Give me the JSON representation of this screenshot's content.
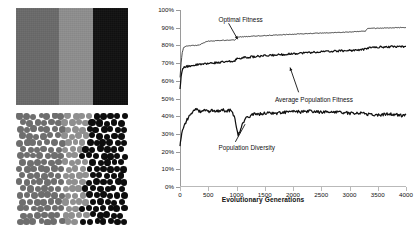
{
  "figure": {
    "bands_panel": {
      "name": "grayscale-bands-image",
      "bands": [
        {
          "label": "dark-gray-band",
          "color": "#6a6a6a",
          "width_pct": 38
        },
        {
          "label": "light-gray-band",
          "color": "#8e8e8e",
          "width_pct": 31
        },
        {
          "label": "black-band",
          "color": "#111111",
          "width_pct": 31
        }
      ]
    },
    "circles_panel": {
      "name": "circle-packing-image",
      "colors": {
        "left": "#6e6e6e",
        "middle": "#8f8f8f",
        "right": "#0d0d0d"
      },
      "dot_radius": 3.2,
      "columns": 16,
      "rows": 17
    }
  },
  "chart_data": {
    "type": "line",
    "title": "",
    "xlabel": "Evolutionary Generations",
    "ylabel": "",
    "xlim": [
      0,
      4000
    ],
    "ylim": [
      0,
      100
    ],
    "grid": false,
    "legend_position": "inline-annotations",
    "xticks": [
      0,
      500,
      1000,
      1500,
      2000,
      2500,
      3000,
      3500,
      4000
    ],
    "xtick_labels": [
      "0",
      "500",
      "1000",
      "1500",
      "2000",
      "2500",
      "3000",
      "3500",
      "4000"
    ],
    "yticks": [
      0,
      10,
      20,
      30,
      40,
      50,
      60,
      70,
      80,
      90,
      100
    ],
    "ytick_labels": [
      "0%",
      "10%",
      "20%",
      "30%",
      "40%",
      "50%",
      "60%",
      "70%",
      "80%",
      "90%",
      "100%"
    ],
    "series": [
      {
        "name": "Optimal Fitness",
        "color": "#1a1a1a",
        "x": [
          0,
          20,
          40,
          60,
          80,
          120,
          180,
          260,
          340,
          420,
          500,
          600,
          700,
          800,
          900,
          980,
          1020,
          1100,
          1250,
          1400,
          1600,
          1800,
          2000,
          2200,
          2400,
          2600,
          2800,
          3000,
          3150,
          3280,
          3320,
          3400,
          3600,
          3800,
          3950,
          4000
        ],
        "values": [
          62,
          70,
          76,
          78.5,
          79.2,
          79.6,
          79.8,
          80.0,
          80.2,
          81.5,
          82.4,
          82.6,
          82.8,
          82.9,
          83.0,
          83.1,
          84.6,
          84.9,
          85.1,
          85.4,
          85.7,
          86.0,
          86.3,
          86.6,
          86.9,
          87.1,
          87.3,
          87.6,
          87.8,
          88.0,
          89.4,
          89.6,
          89.8,
          90.0,
          90.1,
          90.1
        ]
      },
      {
        "name": "Average Population Fitness",
        "color": "#111111",
        "x": [
          0,
          20,
          40,
          60,
          90,
          140,
          200,
          300,
          400,
          500,
          620,
          740,
          860,
          960,
          1010,
          1080,
          1200,
          1350,
          1500,
          1700,
          1900,
          2100,
          2300,
          2500,
          2700,
          2900,
          3100,
          3250,
          3320,
          3450,
          3600,
          3750,
          3900,
          4000
        ],
        "values": [
          55,
          62,
          66,
          67.2,
          67.8,
          68.2,
          68.6,
          69.0,
          69.4,
          69.8,
          70.2,
          70.5,
          70.8,
          71.0,
          72.6,
          72.9,
          73.3,
          73.7,
          74.1,
          74.6,
          75.1,
          75.6,
          76.0,
          76.4,
          76.7,
          77.0,
          77.3,
          77.6,
          78.6,
          78.9,
          79.1,
          79.3,
          79.4,
          79.4
        ]
      },
      {
        "name": "Population Diversity",
        "color": "#111111",
        "x": [
          0,
          15,
          30,
          60,
          100,
          150,
          200,
          250,
          300,
          350,
          420,
          500,
          580,
          660,
          740,
          820,
          900,
          960,
          1000,
          1030,
          1060,
          1100,
          1160,
          1250,
          1350,
          1450,
          1550,
          1700,
          1850,
          2000,
          2150,
          2300,
          2450,
          2600,
          2750,
          2900,
          3050,
          3200,
          3350,
          3500,
          3650,
          3800,
          3920,
          4000
        ],
        "values": [
          23,
          27,
          30,
          33,
          36.5,
          39.5,
          42.0,
          43.2,
          43.8,
          42.6,
          43.6,
          42.4,
          43.4,
          42.8,
          43.6,
          43.0,
          43.4,
          40.0,
          34.0,
          29.5,
          31.5,
          35.0,
          38.5,
          40.5,
          41.5,
          41.2,
          42.0,
          41.6,
          42.2,
          42.6,
          42.4,
          42.8,
          42.4,
          42.2,
          42.6,
          42.0,
          41.6,
          42.0,
          41.0,
          40.6,
          41.2,
          41.0,
          40.4,
          40.8
        ]
      }
    ],
    "annotations": [
      {
        "name": "annotation-optimal-fitness",
        "text": "Optimal Fitness",
        "x_pct": 17,
        "y_pct": 4
      },
      {
        "name": "annotation-average-population-fitness",
        "text": "Average Population Fitness",
        "x_pct": 42,
        "y_pct": 49
      },
      {
        "name": "annotation-population-diversity",
        "text": "Population Diversity",
        "x_pct": 17,
        "y_pct": 76
      }
    ]
  }
}
